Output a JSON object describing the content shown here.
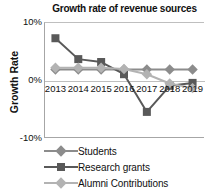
{
  "chart_data": {
    "type": "line",
    "title": "Growth rate of revenue sources",
    "xlabel": "",
    "ylabel": "Growth Rate",
    "categories": [
      "2013",
      "2014",
      "2015",
      "2016",
      "2017",
      "2018",
      "2019"
    ],
    "ylim": [
      -10,
      10
    ],
    "ytick_labels": [
      "10%",
      "0%",
      "-10%"
    ],
    "ytick_values": [
      10,
      0,
      -10
    ],
    "grid": false,
    "legend_position": "bottom",
    "series": [
      {
        "name": "Students",
        "color": "#8c8c8c",
        "marker": "diamond",
        "values": [
          1.8,
          1.8,
          1.8,
          1.8,
          1.8,
          1.8,
          1.8
        ]
      },
      {
        "name": "Research grants",
        "color": "#595959",
        "marker": "square",
        "values": [
          7.2,
          3.6,
          3.1,
          1.0,
          -5.5,
          -1.0,
          -0.5
        ]
      },
      {
        "name": "Alumni Contributions",
        "color": "#b3b3b3",
        "marker": "diamond",
        "values": [
          2.1,
          2.1,
          2.1,
          1.9,
          1.0,
          -0.6,
          -1.4
        ]
      }
    ]
  }
}
